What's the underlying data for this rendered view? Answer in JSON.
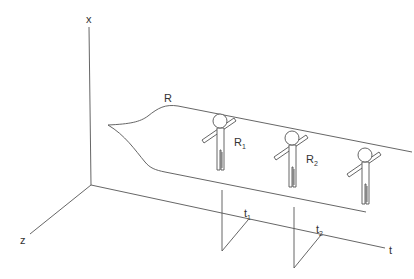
{
  "axes": {
    "x_label": "x",
    "z_label": "z",
    "t_label": "t"
  },
  "ribbon": {
    "label": "R"
  },
  "figures": [
    {
      "label_main": "R",
      "label_sub": "1"
    },
    {
      "label_main": "R",
      "label_sub": "2"
    },
    {
      "label_main": "",
      "label_sub": ""
    }
  ],
  "time_marks": [
    {
      "label_main": "t",
      "label_sub": "1"
    },
    {
      "label_main": "t",
      "label_sub": "2"
    }
  ],
  "colors": {
    "stroke": "#555555",
    "text": "#333333",
    "background": "#ffffff"
  }
}
